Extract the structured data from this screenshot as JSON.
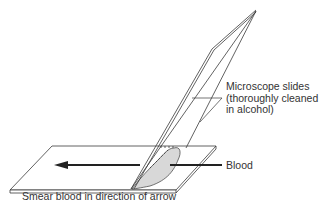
{
  "diagram": {
    "labels": {
      "slides_line1": "Microscope slides",
      "slides_line2": "(thoroughly cleaned",
      "slides_line3": "in alcohol)",
      "blood": "Blood",
      "caption": "Smear blood in direction of arrow"
    },
    "colors": {
      "line": "#3a3a3a",
      "arrow": "#222222",
      "blood_fill": "#d8d8d8",
      "background": "#ffffff"
    }
  }
}
